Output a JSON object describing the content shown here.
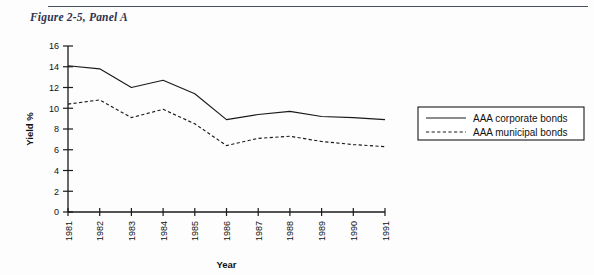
{
  "figure": {
    "title": "Figure 2-5, Panel A"
  },
  "chart_data": {
    "type": "line",
    "title": "Figure 2-5, Panel A",
    "xlabel": "Year",
    "ylabel": "Yield %",
    "categories": [
      "1981",
      "1982",
      "1983",
      "1984",
      "1985",
      "1986",
      "1987",
      "1988",
      "1989",
      "1990",
      "1991"
    ],
    "x": [
      1981,
      1982,
      1983,
      1984,
      1985,
      1986,
      1987,
      1988,
      1989,
      1990,
      1991
    ],
    "ylim": [
      0,
      16
    ],
    "yticks": [
      "0",
      "2",
      "4",
      "6",
      "8",
      "10",
      "12",
      "14",
      "16"
    ],
    "ytick_values": [
      0,
      2,
      4,
      6,
      8,
      10,
      12,
      14,
      16
    ],
    "xlim": [
      1981,
      1991
    ],
    "grid": false,
    "legend_position": "right",
    "series": [
      {
        "name": "AAA corporate bonds",
        "style": "solid",
        "color": "#1a1a1a",
        "values": [
          14.1,
          13.8,
          12.0,
          12.7,
          11.4,
          8.9,
          9.4,
          9.7,
          9.2,
          9.1,
          8.9
        ]
      },
      {
        "name": "AAA municipal bonds",
        "style": "dashed",
        "color": "#1a1a1a",
        "values": [
          10.4,
          10.8,
          9.1,
          9.9,
          8.5,
          6.4,
          7.1,
          7.3,
          6.8,
          6.5,
          6.3
        ]
      }
    ]
  }
}
